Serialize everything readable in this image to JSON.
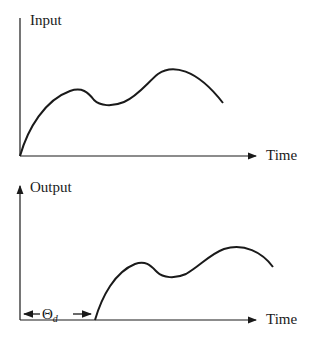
{
  "diagram": {
    "type": "time-delay illustration",
    "top_plot": {
      "y_label": "Input",
      "x_label": "Time",
      "curve_points": [
        [
          20,
          156
        ],
        [
          40,
          115
        ],
        [
          60,
          95
        ],
        [
          75,
          90
        ],
        [
          85,
          92
        ],
        [
          95,
          102
        ],
        [
          105,
          104
        ],
        [
          125,
          102
        ],
        [
          145,
          88
        ],
        [
          160,
          73
        ],
        [
          172,
          69
        ],
        [
          190,
          73
        ],
        [
          210,
          88
        ],
        [
          223,
          103
        ]
      ]
    },
    "bottom_plot": {
      "y_label": "Output",
      "x_label": "Time",
      "delay_label": "Θ",
      "delay_subscript": "d",
      "curve_points": [
        [
          95,
          320
        ],
        [
          110,
          288
        ],
        [
          128,
          266
        ],
        [
          142,
          263
        ],
        [
          152,
          268
        ],
        [
          162,
          276
        ],
        [
          172,
          276
        ],
        [
          190,
          270
        ],
        [
          210,
          254
        ],
        [
          233,
          248
        ],
        [
          255,
          253
        ],
        [
          273,
          267
        ]
      ]
    },
    "colors": {
      "ink": "#1a1a1a",
      "background": "#ffffff"
    }
  }
}
